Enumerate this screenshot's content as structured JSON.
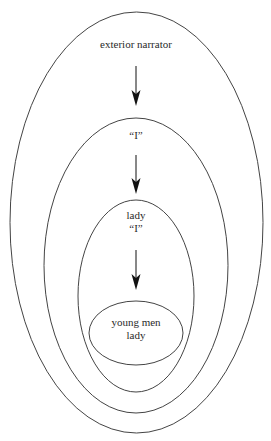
{
  "diagram": {
    "type": "nested-ellipses",
    "stroke_color": "#444444",
    "arrow_color": "#111111",
    "levels": [
      {
        "id": "level-1",
        "lines": [
          "exterior narrator"
        ],
        "ellipse": {
          "cx": 136.5,
          "cy": 222.5,
          "rx": 126.5,
          "ry": 210.5
        }
      },
      {
        "id": "level-2",
        "lines": [
          "“I”"
        ],
        "ellipse": {
          "cx": 136,
          "cy": 265.5,
          "rx": 92,
          "ry": 147.5
        }
      },
      {
        "id": "level-3",
        "lines": [
          "lady",
          "“I”"
        ],
        "ellipse": {
          "cx": 136,
          "cy": 296,
          "rx": 58,
          "ry": 96
        }
      },
      {
        "id": "level-4",
        "lines": [
          "young men",
          "lady"
        ],
        "ellipse": {
          "cx": 136,
          "cy": 333,
          "rx": 47,
          "ry": 32
        }
      }
    ],
    "arrows": [
      {
        "from": "level-1",
        "to": "level-2",
        "x": 136,
        "y1": 66,
        "y2": 106
      },
      {
        "from": "level-2",
        "to": "level-3",
        "x": 136,
        "y1": 155,
        "y2": 194
      },
      {
        "from": "level-3",
        "to": "level-4",
        "x": 136,
        "y1": 250,
        "y2": 290
      }
    ],
    "label_positions": [
      {
        "x": 136,
        "y": 44
      },
      {
        "x": 136,
        "y": 136
      },
      {
        "x": 136,
        "y": 211
      },
      {
        "x": 136,
        "y": 321
      }
    ]
  }
}
